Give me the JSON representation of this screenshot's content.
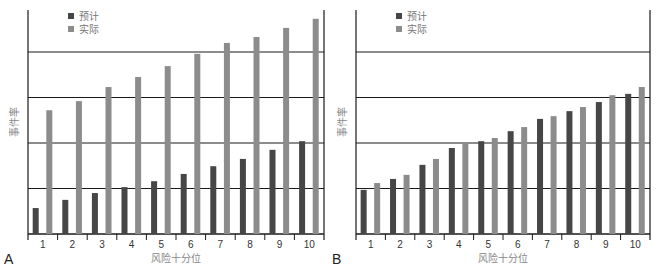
{
  "chart_data": [
    {
      "type": "bar",
      "panel_label": "A",
      "title": "",
      "xlabel": "风险十分位",
      "ylabel": "事件率",
      "categories": [
        "1",
        "2",
        "3",
        "4",
        "5",
        "6",
        "7",
        "8",
        "9",
        "10"
      ],
      "series": [
        {
          "name": "预计",
          "color": "#464646",
          "values": [
            0.57,
            0.75,
            0.9,
            1.03,
            1.16,
            1.32,
            1.49,
            1.65,
            1.85,
            2.04
          ]
        },
        {
          "name": "实际",
          "color": "#8c8c8c",
          "values": [
            2.72,
            2.92,
            3.23,
            3.45,
            3.69,
            3.96,
            4.2,
            4.33,
            4.53,
            4.73
          ]
        }
      ],
      "ylim": [
        0,
        4.9
      ],
      "gridlines": [
        1,
        2,
        3,
        4
      ],
      "grid": true,
      "yticks_labeled": false,
      "legend_position": "top-left"
    },
    {
      "type": "bar",
      "panel_label": "B",
      "title": "",
      "xlabel": "风险十分位",
      "ylabel": "事件率",
      "categories": [
        "1",
        "2",
        "3",
        "4",
        "5",
        "6",
        "7",
        "8",
        "9",
        "10"
      ],
      "series": [
        {
          "name": "预计",
          "color": "#464646",
          "values": [
            0.97,
            1.21,
            1.52,
            1.89,
            2.04,
            2.26,
            2.53,
            2.7,
            2.9,
            3.08
          ]
        },
        {
          "name": "实际",
          "color": "#8c8c8c",
          "values": [
            1.12,
            1.3,
            1.65,
            2.0,
            2.11,
            2.35,
            2.59,
            2.79,
            3.05,
            3.23
          ]
        }
      ],
      "ylim": [
        0,
        4.9
      ],
      "gridlines": [
        1,
        2,
        3,
        4
      ],
      "grid": true,
      "yticks_labeled": false,
      "legend_position": "top-left"
    }
  ]
}
